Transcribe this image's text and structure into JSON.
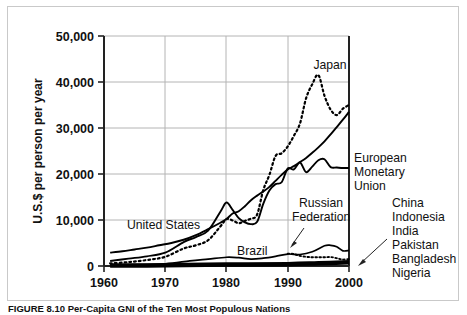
{
  "figure": {
    "caption": "FIGURE 8.10 Per-Capita GNI of the Ten Most Populous Nations"
  },
  "axes": {
    "y_title": "U.S.$ per person per year",
    "y_ticks": [
      "0",
      "10,000",
      "20,000",
      "30,000",
      "40,000",
      "50,000"
    ],
    "x_ticks": [
      "1960",
      "1970",
      "1980",
      "1990",
      "2000"
    ]
  },
  "labels": {
    "japan": "Japan",
    "united_states": "United States",
    "brazil": "Brazil",
    "emu_line1": "European",
    "emu_line2": "Monetary",
    "emu_line3": "Union",
    "russia_line1": "Russian",
    "russia_line2": "Federation",
    "cluster_1": "China",
    "cluster_2": "Indonesia",
    "cluster_3": "India",
    "cluster_4": "Pakistan",
    "cluster_5": "Bangladesh",
    "cluster_6": "Nigeria"
  },
  "colors": {
    "line": "#000000",
    "grid": "#b4b4b4",
    "axis": "#222222",
    "frame": "#c9c9c9",
    "text": "#111111"
  },
  "chart_data": {
    "type": "line",
    "title": "",
    "xlabel": "",
    "ylabel": "U.S.$ per person per year",
    "xlim": [
      1960,
      2000
    ],
    "ylim": [
      0,
      50000
    ],
    "grid": true,
    "legend": "inline-annotations",
    "xticks": [
      1960,
      1970,
      1980,
      1990,
      2000
    ],
    "yticks": [
      0,
      10000,
      20000,
      30000,
      40000,
      50000
    ],
    "series": [
      {
        "name": "United States",
        "style": "solid",
        "x": [
          1961,
          1963,
          1965,
          1967,
          1969,
          1971,
          1973,
          1975,
          1977,
          1979,
          1980,
          1981,
          1982,
          1983,
          1984,
          1985,
          1986,
          1987,
          1988,
          1989,
          1990,
          1991,
          1992,
          1993,
          1994,
          1995,
          1996,
          1997,
          1998,
          1999,
          2000
        ],
        "values": [
          2900,
          3200,
          3600,
          4000,
          4500,
          5000,
          5700,
          6700,
          8000,
          9400,
          10200,
          11400,
          11900,
          13000,
          14300,
          15300,
          16200,
          17200,
          18500,
          19800,
          21000,
          21700,
          22600,
          23500,
          24600,
          25800,
          27100,
          28600,
          30200,
          31800,
          33500
        ]
      },
      {
        "name": "Japan",
        "style": "dotted",
        "x": [
          1961,
          1964,
          1967,
          1970,
          1973,
          1975,
          1977,
          1979,
          1980,
          1981,
          1982,
          1983,
          1984,
          1985,
          1986,
          1987,
          1988,
          1989,
          1990,
          1991,
          1992,
          1993,
          1994,
          1995,
          1996,
          1997,
          1998,
          1999,
          2000
        ],
        "values": [
          550,
          850,
          1300,
          2000,
          3800,
          4500,
          5600,
          8600,
          10200,
          9900,
          9300,
          9800,
          10300,
          11200,
          16500,
          19800,
          23900,
          24500,
          26000,
          28300,
          31000,
          36500,
          39500,
          41500,
          37000,
          34000,
          32800,
          34200,
          35000
        ]
      },
      {
        "name": "European Monetary Union",
        "style": "solid",
        "x": [
          1961,
          1964,
          1967,
          1970,
          1973,
          1975,
          1977,
          1979,
          1980,
          1981,
          1982,
          1983,
          1984,
          1985,
          1986,
          1987,
          1988,
          1989,
          1990,
          1991,
          1992,
          1993,
          1994,
          1995,
          1996,
          1997,
          1998,
          1999,
          2000
        ],
        "values": [
          1100,
          1600,
          2100,
          2900,
          5200,
          6300,
          7700,
          11800,
          13800,
          12200,
          10400,
          9500,
          9100,
          9600,
          13500,
          16400,
          17800,
          18200,
          21200,
          21000,
          22500,
          20400,
          21600,
          23000,
          23200,
          21500,
          21400,
          21300,
          21300
        ]
      },
      {
        "name": "Brazil",
        "style": "solid",
        "x": [
          1961,
          1965,
          1970,
          1974,
          1977,
          1980,
          1982,
          1984,
          1986,
          1988,
          1990,
          1992,
          1994,
          1996,
          1997,
          1998,
          1999,
          2000
        ],
        "values": [
          250,
          300,
          480,
          1100,
          1500,
          1900,
          1800,
          1500,
          1700,
          2100,
          2600,
          2500,
          3100,
          4400,
          4500,
          4200,
          3300,
          3400
        ]
      },
      {
        "name": "Russian Federation",
        "style": "dotted",
        "x": [
          1990,
          1991,
          1992,
          1993,
          1994,
          1995,
          1996,
          1997,
          1998,
          1999,
          2000
        ],
        "values": [
          2700,
          2600,
          2200,
          2000,
          1900,
          1900,
          1900,
          1950,
          1700,
          1400,
          1500
        ]
      },
      {
        "name": "China / Indonesia / India / Pakistan / Bangladesh / Nigeria",
        "style": "solid-band",
        "x": [
          1961,
          1970,
          1980,
          1990,
          1995,
          2000
        ],
        "values": [
          100,
          150,
          300,
          400,
          600,
          800
        ]
      }
    ],
    "annotations": [
      {
        "text": "Japan",
        "x": 1995,
        "y": 45500
      },
      {
        "text": "United States",
        "x": 1969,
        "y": 9100
      },
      {
        "text": "Brazil",
        "x": 1983,
        "y": 3200
      },
      {
        "text": "European Monetary Union",
        "x": 2001,
        "y": 24500
      },
      {
        "text": "Russian Federation",
        "x": 1993,
        "y": 10800,
        "arrow_to": [
          1991,
          2700
        ]
      },
      {
        "text": "China Indonesia India Pakistan Bangladesh Nigeria",
        "x": 2002,
        "y": 10500,
        "arrow_to": [
          2000,
          500
        ]
      }
    ]
  }
}
